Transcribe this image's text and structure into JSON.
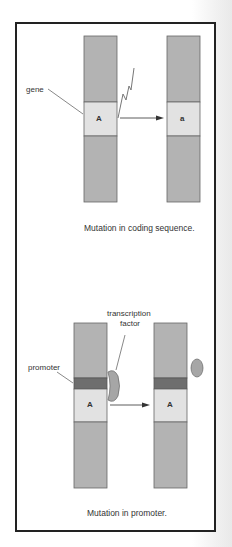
{
  "panels": [
    {
      "id": "coding",
      "labels": {
        "gene": "gene"
      },
      "before_allele": "A",
      "after_allele": "a",
      "caption": "Mutation in coding sequence."
    },
    {
      "id": "promoter",
      "labels": {
        "promoter": "promoter",
        "transcription_factor_line1": "transcription",
        "transcription_factor_line2": "factor"
      },
      "before_allele": "A",
      "after_allele": "A",
      "caption": "Mutation in promoter."
    }
  ],
  "colors": {
    "chromosome": "#b3b3b3",
    "gene": "#e2e2e2",
    "promoter": "#6e6e6e",
    "factor": "#a6a6a6",
    "border": "#222222"
  }
}
